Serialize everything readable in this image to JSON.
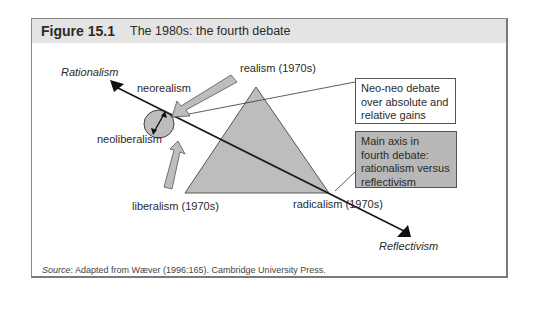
{
  "figure": {
    "number": "Figure 15.1",
    "title": "The 1980s: the fourth debate"
  },
  "diagram": {
    "axis": {
      "top_label": "Rationalism",
      "bottom_label": "Reflectivism"
    },
    "triangle_vertices": {
      "apex": "realism (1970s)",
      "bottom_left": "liberalism (1970s)",
      "bottom_right": "radicalism (1970s)"
    },
    "circle_labels": {
      "upper": "neorealism",
      "lower": "neoliberalism"
    },
    "callouts": [
      {
        "text_lines": [
          "Neo-neo debate",
          "over absolute and",
          "relative gains"
        ],
        "fill": "#ffffff"
      },
      {
        "text_lines": [
          "Main axis in",
          "fourth debate:",
          "rationalism versus",
          "reflectivism"
        ],
        "fill": "#b8b8b8"
      }
    ],
    "colors": {
      "shape_fill": "#bdbdbd",
      "stroke": "#1a1a1a",
      "header_bg": "#e4e4e4"
    }
  },
  "source": {
    "label": "Source",
    "text": ": Adapted from Wæver (1996:165). Cambridge University Press."
  }
}
